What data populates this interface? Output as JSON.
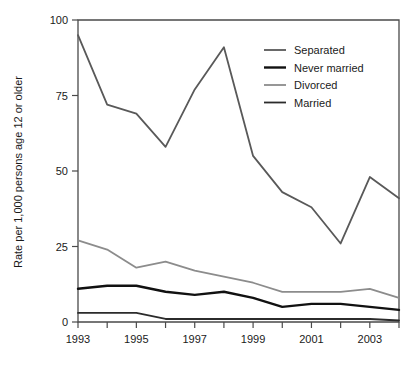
{
  "chart_data": {
    "type": "line",
    "title": "",
    "xlabel": "",
    "ylabel": "Rate per 1,000 persons age 12 or older",
    "x": [
      1993,
      1994,
      1995,
      1996,
      1997,
      1998,
      1999,
      2000,
      2001,
      2002,
      2003,
      2004
    ],
    "xlim": [
      1993,
      2004
    ],
    "ylim": [
      0,
      100
    ],
    "yticks": [
      0,
      25,
      50,
      75,
      100
    ],
    "ytick_labels": [
      "0",
      "25",
      "50",
      "75",
      "100"
    ],
    "xticks": [
      1993,
      1994,
      1995,
      1996,
      1997,
      1998,
      1999,
      2000,
      2001,
      2002,
      2003,
      2004
    ],
    "xtick_labels": [
      "1993",
      "",
      "1995",
      "",
      "1997",
      "",
      "1999",
      "",
      "2001",
      "",
      "2003",
      ""
    ],
    "grid": false,
    "legend_position": "top-right",
    "series": [
      {
        "name": "Separated",
        "color": "#595959",
        "width": 1.8,
        "values": [
          95,
          72,
          69,
          58,
          77,
          91,
          55,
          43,
          38,
          26,
          48,
          41
        ]
      },
      {
        "name": "Never married",
        "color": "#111111",
        "width": 2.4,
        "values": [
          11,
          12,
          12,
          10,
          9,
          10,
          8,
          5,
          6,
          6,
          5,
          4
        ]
      },
      {
        "name": "Divorced",
        "color": "#8c8c8c",
        "width": 1.8,
        "values": [
          27,
          24,
          18,
          20,
          17,
          15,
          13,
          10,
          10,
          10,
          11,
          8
        ]
      },
      {
        "name": "Married",
        "color": "#2b2b2b",
        "width": 1.8,
        "values": [
          3,
          3,
          3,
          1,
          1,
          1,
          1,
          1,
          1,
          1,
          1,
          0.5
        ]
      }
    ]
  },
  "legend": {
    "items": [
      {
        "label": "Separated"
      },
      {
        "label": "Never married"
      },
      {
        "label": "Divorced"
      },
      {
        "label": "Married"
      }
    ]
  },
  "axis": {
    "y_title": "Rate per 1,000 persons age 12 or older"
  }
}
